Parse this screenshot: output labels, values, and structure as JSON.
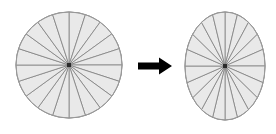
{
  "figure": {
    "title": "",
    "background_color": "#ffffff",
    "width": 276,
    "height": 134
  },
  "chart_data": {
    "type": "pie",
    "title": "",
    "subtitle": "",
    "xlabel": "",
    "ylabel": "",
    "legend_position": "none",
    "grid": false,
    "categories": [
      "s1",
      "s2",
      "s3",
      "s4",
      "s5",
      "s6",
      "s7",
      "s8",
      "s9",
      "s10",
      "s11",
      "s12",
      "s13",
      "s14",
      "s15",
      "s16",
      "s17",
      "s18",
      "s19",
      "s20"
    ],
    "values": [
      1,
      1,
      1,
      1,
      1,
      1,
      1,
      1,
      1,
      1,
      1,
      1,
      1,
      1,
      1,
      1,
      1,
      1,
      1,
      1
    ],
    "sector_count": 20,
    "sector_angle_degrees": 18,
    "series": [
      {
        "name": "source-circle",
        "shape": "circle",
        "center_x": 69,
        "center_y": 65,
        "radius_x": 53,
        "radius_y": 53,
        "sector_count": 20,
        "values": [
          1,
          1,
          1,
          1,
          1,
          1,
          1,
          1,
          1,
          1,
          1,
          1,
          1,
          1,
          1,
          1,
          1,
          1,
          1,
          1
        ]
      },
      {
        "name": "target-ellipse",
        "shape": "ellipse",
        "center_x": 225,
        "center_y": 66,
        "radius_x": 40,
        "radius_y": 54,
        "sector_count": 20,
        "values": [
          1,
          1,
          1,
          1,
          1,
          1,
          1,
          1,
          1,
          1,
          1,
          1,
          1,
          1,
          1,
          1,
          1,
          1,
          1,
          1
        ]
      }
    ],
    "annotations": [
      {
        "name": "transform-arrow",
        "type": "arrow",
        "direction": "right",
        "label": "",
        "x1": 138,
        "y1": 66,
        "x2": 172,
        "y2": 66,
        "color": "#000000"
      }
    ]
  },
  "style": {
    "sector_fill": "#e9e9e9",
    "sector_stroke": "#808080",
    "outline_stroke": "#9a9a9a",
    "hub_color": "#2b2b2b",
    "arrow_color": "#000000",
    "stroke_width": 0.8,
    "outline_width": 0.9,
    "hub_size": 4
  },
  "labels": {
    "left_shape_name": "circle",
    "right_shape_name": "ellipse",
    "arrow_name": "arrow"
  }
}
